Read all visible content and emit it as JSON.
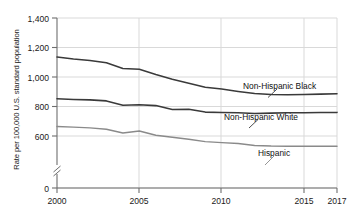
{
  "axis": {
    "ylabel": "Rate per 100,000 U.S. standard population",
    "xlabel": "",
    "y_ticks": [
      "1,400",
      "1,200",
      "1,000",
      "800",
      "600",
      "0"
    ],
    "x_ticks": [
      "2000",
      "2005",
      "2010",
      "2015",
      "2017"
    ],
    "break_symbol": "axis-break"
  },
  "labels": {
    "black": "Non-Hispanic Black",
    "white": "Non-Hispanic White",
    "hispanic": "Hispanic"
  },
  "colors": {
    "black_line": "#3a3a3a",
    "white_line": "#3a3a3a",
    "hispanic_line": "#8a8a8a",
    "grid": "#d9d9d9",
    "axis": "#6e6e6e",
    "text": "#1a1a1a"
  },
  "chart_data": {
    "type": "line",
    "title": "",
    "xlabel": "",
    "ylabel": "Rate per 100,000 U.S. standard population",
    "xlim": [
      2000,
      2017
    ],
    "ylim": [
      550,
      1450
    ],
    "y_axis_break": {
      "between": [
        0,
        600
      ],
      "note": "axis broken below 600"
    },
    "y_ticks": [
      600,
      800,
      1000,
      1200,
      1400
    ],
    "x_ticks": [
      2000,
      2005,
      2010,
      2015,
      2017
    ],
    "grid": true,
    "legend": "inline-annotations",
    "x": [
      2000,
      2001,
      2002,
      2003,
      2004,
      2005,
      2006,
      2007,
      2008,
      2009,
      2010,
      2011,
      2012,
      2013,
      2014,
      2015,
      2016,
      2017
    ],
    "series": [
      {
        "name": "Non-Hispanic Black",
        "values": [
          1135,
          1122,
          1112,
          1097,
          1058,
          1052,
          1017,
          985,
          957,
          930,
          918,
          902,
          888,
          882,
          880,
          881,
          884,
          886
        ]
      },
      {
        "name": "Non-Hispanic White",
        "values": [
          852,
          848,
          845,
          838,
          808,
          812,
          806,
          780,
          782,
          762,
          760,
          758,
          753,
          755,
          757,
          758,
          759,
          760
        ]
      },
      {
        "name": "Hispanic",
        "values": [
          665,
          660,
          655,
          646,
          620,
          634,
          605,
          591,
          578,
          562,
          555,
          549,
          536,
          532,
          531,
          530,
          530,
          530
        ]
      }
    ]
  }
}
